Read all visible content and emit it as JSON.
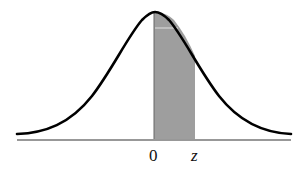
{
  "diagram": {
    "type": "standard-normal-curve",
    "shaded_region": {
      "from": "0",
      "to": "z",
      "color": "#9e9e9e"
    },
    "curve_color": "#000000",
    "axis_color": "#333333",
    "labels": {
      "zero": "0",
      "z": "z"
    }
  }
}
